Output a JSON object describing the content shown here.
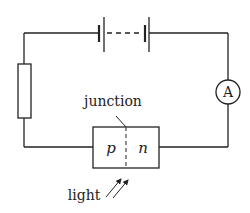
{
  "diagram": {
    "type": "circuit",
    "components": {
      "battery": {
        "label": "",
        "cells": 2,
        "dashed_between": true
      },
      "resistor": {
        "label": ""
      },
      "ammeter": {
        "symbol": "A"
      },
      "photodiode": {
        "p_label": "p",
        "n_label": "n"
      }
    },
    "labels": {
      "junction": "junction",
      "light": "light"
    },
    "colors": {
      "stroke": "#222222",
      "dashed": "#555555",
      "background": "#ffffff"
    }
  }
}
